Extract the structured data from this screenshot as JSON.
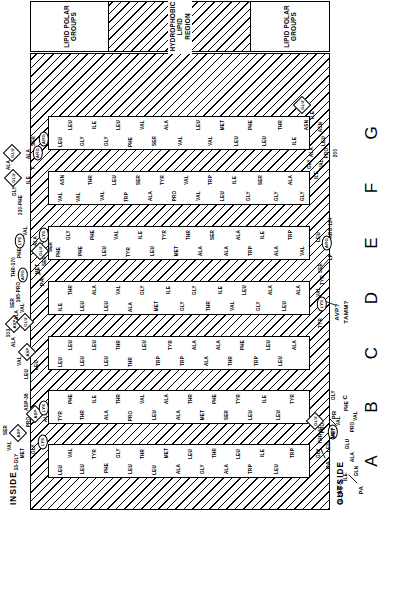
{
  "figure": {
    "type": "membrane-protein-topology",
    "panel_letters": [
      "A",
      "B",
      "C",
      "D",
      "E",
      "F",
      "G"
    ],
    "membrane": {
      "inside_label": "INSIDE",
      "outside_label": "OUTSIDE",
      "lipid_polar_groups_top": "LIPID POLAR\nGROUPS",
      "lipid_polar_groups_bottom": "LIPID POLAR\nGROUPS",
      "hydrophobic_region": "HYDROPHOBIC\nLIPID\nREGION"
    },
    "helices": [
      {
        "id": "A",
        "label": "A",
        "residues": [
          "LEU",
          "VAL",
          "LEU",
          "TYR",
          "PHE",
          "GLY",
          "LEU",
          "THR",
          "LEU",
          "MET",
          "ALA",
          "LEU",
          "GLY",
          "THR",
          "ALA",
          "LEU",
          "TRP",
          "ILE",
          "LEU",
          "TRP"
        ]
      },
      {
        "id": "B",
        "label": "B",
        "residues": [
          "TYR",
          "PHE",
          "THR",
          "ILE",
          "ALA",
          "THR",
          "PRO",
          "VAL",
          "LEU",
          "ALA",
          "ALA",
          "THR",
          "MET",
          "PHE",
          "SER",
          "TYR",
          "LEU",
          "ILE",
          "LEU",
          "TYR"
        ]
      },
      {
        "id": "C",
        "label": "C",
        "residues": [
          "LEU",
          "LEU",
          "LEU",
          "LEU",
          "LEU",
          "THR",
          "THR",
          "LEU",
          "TRP",
          "TYR",
          "TRP",
          "ALA",
          "ALA",
          "ALA",
          "THR",
          "PHE",
          "TRP",
          "LEU",
          "LEU",
          "ALA"
        ]
      },
      {
        "id": "D",
        "label": "D",
        "residues": [
          "ILE",
          "THR",
          "LEU",
          "ALA",
          "LEU",
          "VAL",
          "ALA",
          "GLY",
          "MET",
          "ILE",
          "GLY",
          "GLY",
          "THR",
          "ILE",
          "VAL",
          "LEU",
          "GLY",
          "ALA",
          "LEU",
          "ALA"
        ]
      },
      {
        "id": "E",
        "label": "E",
        "residues": [
          "PHE",
          "GLY",
          "PHE",
          "PHE",
          "LEU",
          "VAL",
          "TYR",
          "ILE",
          "LEU",
          "TYR",
          "MET",
          "THR",
          "ALA",
          "SER",
          "ALA",
          "ALA",
          "TRP",
          "ILE",
          "ALA",
          "TRP",
          "VAL"
        ]
      },
      {
        "id": "F",
        "label": "F",
        "residues": [
          "VAL",
          "ASN",
          "VAL",
          "THR",
          "VAL",
          "LEU",
          "TRP",
          "SER",
          "ALA",
          "TYR",
          "PRO",
          "VAL",
          "VAL",
          "TRP",
          "LEU",
          "ILE",
          "GLY",
          "SER",
          "GLY",
          "ALA",
          "GLY"
        ]
      },
      {
        "id": "G",
        "label": "G",
        "residues": [
          "LEU",
          "LEU",
          "GLY",
          "ILE",
          "GLY",
          "LEU",
          "PHE",
          "VAL",
          "SER",
          "ALA",
          "VAL",
          "LEU",
          "VAL",
          "MET",
          "LEU",
          "PHE",
          "LEU",
          "THR",
          "ILE",
          "ASN"
        ]
      }
    ],
    "charged_residues": {
      "acidic_diamond": [
        "GLU",
        "ASP"
      ],
      "basic_oval": [
        "ARG",
        "LYS"
      ]
    },
    "loops": {
      "n_terminus_outside": {
        "chain": [
          "GLY",
          "THR-5",
          "ILE",
          "GLN",
          "ALA",
          "GLU",
          "PRO",
          "PHE",
          "VAL",
          "THR"
        ],
        "palmitoyl_label": "PA",
        "marker": "THR-5"
      },
      "ab_loop_outside": {
        "chain": [
          "GLY",
          "LEU",
          "THR-67",
          "MET",
          "VAL",
          "PRO",
          "PHE"
        ],
        "palmitoyl_label": "PA",
        "marker": "THR-67"
      },
      "ab_loop_inside": {
        "chain": [
          "SER",
          "VAL",
          "PRO",
          "ALA",
          "MET",
          "GLY"
        ],
        "markers": [
          "33-GLY",
          "ASP-38"
        ],
        "charged": [
          "ASP",
          "LYS",
          "LYS"
        ]
      },
      "cd_loop_inside": {
        "chain": [
          "VAL",
          "ALA",
          "LEU",
          "LEU"
        ],
        "markers": [
          "103"
        ],
        "charged": [
          "ASP",
          "ASP"
        ]
      },
      "cd_loop_outside": {
        "chain": [
          "TYR",
          "VAL",
          "TYR",
          "SER",
          "LEU"
        ],
        "markers": [
          "AVP?",
          "TAMM?",
          "ARG-134",
          "LP"
        ],
        "charged": [
          "LYS",
          "ARG"
        ]
      },
      "ef_loop_inside": {
        "chain": [
          "VAL",
          "ALA",
          "SER",
          "PHE",
          "VAL",
          "LEU"
        ],
        "markers": [
          "165-PRO",
          "THR-170"
        ],
        "charged": [
          "GLU",
          "ARG",
          "GLU",
          "LYS",
          "LYS"
        ],
        "palmitoyl_label": "PA",
        "extra": [
          "MET",
          "SER",
          "SER",
          "ALA"
        ]
      },
      "fg_loop_outside": {
        "chain": [
          "ILE",
          "VAL",
          "GLY",
          "ALA",
          "LEU",
          "ASN",
          "ILE"
        ],
        "markers": [
          "PRO",
          "200"
        ],
        "charged": [
          "GLU"
        ]
      },
      "g_top_inside": {
        "chain": [
          "ALA",
          "GLY",
          "ILE",
          "SER",
          "ALA",
          "ALA",
          "GLY"
        ],
        "markers": [
          "230-PHE",
          "T"
        ],
        "charged": [
          "GLU",
          "GLU",
          "ARG",
          "ARG"
        ]
      },
      "c_terminus": {
        "label": "C",
        "palmitoyl_label": "PR",
        "chain": [
          "PRO",
          "PHE",
          "GLY"
        ]
      }
    },
    "annotations": [
      {
        "text": "230-PHE"
      },
      {
        "text": "THR-170"
      },
      {
        "text": "165-PRO"
      },
      {
        "text": "ARG-134"
      },
      {
        "text": "103"
      },
      {
        "text": "ASP-38"
      },
      {
        "text": "33-GLY"
      },
      {
        "text": "THR-5"
      },
      {
        "text": "THR-67"
      },
      {
        "text": "200"
      },
      {
        "text": "AVP?"
      },
      {
        "text": "TAMM?"
      },
      {
        "text": "PA"
      },
      {
        "text": "PR"
      },
      {
        "text": "LP"
      },
      {
        "text": "T"
      },
      {
        "text": "C"
      }
    ]
  }
}
